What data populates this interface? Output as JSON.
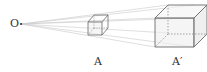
{
  "diagram": {
    "title": "",
    "center_label": "O",
    "object_label": "A",
    "image_label": "A′",
    "colors": {
      "edge": "#6b6b6b",
      "ray": "#c8c8c8",
      "hidden": "#9a9a9a",
      "text": "#333333"
    }
  }
}
